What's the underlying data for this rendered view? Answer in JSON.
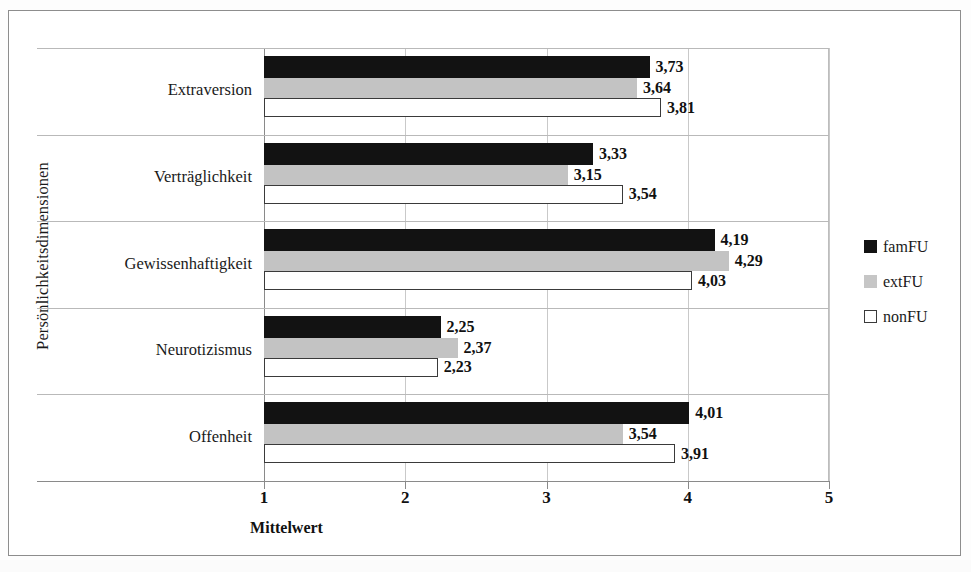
{
  "chart_data": {
    "type": "bar",
    "orientation": "horizontal",
    "title": "",
    "xlabel": "Mittelwert",
    "ylabel": "Persönlichkeitsdimensionen",
    "xlim": [
      1,
      5
    ],
    "xticks": [
      "1",
      "2",
      "3",
      "4",
      "5"
    ],
    "grid": "vertical gridlines at each x tick; horizontal separators between categories",
    "legend_position": "right",
    "categories": [
      "Extraversion",
      "Verträglichkeit",
      "Gewissenhaftigkeit",
      "Neurotizismus",
      "Offenheit"
    ],
    "series": [
      {
        "name": "famFU",
        "color": "#121212",
        "style": "solid-black",
        "values": [
          3.73,
          3.33,
          4.19,
          2.25,
          4.01
        ],
        "labels": [
          "3,73",
          "3,33",
          "4,19",
          "2,25",
          "4,01"
        ]
      },
      {
        "name": "extFU",
        "color": "#c3c3c3",
        "style": "solid-gray",
        "values": [
          3.64,
          3.15,
          4.29,
          2.37,
          3.54
        ],
        "labels": [
          "3,64",
          "3,15",
          "4,29",
          "2,37",
          "3,54"
        ]
      },
      {
        "name": "nonFU",
        "color": "#ffffff",
        "style": "outlined-white",
        "values": [
          3.81,
          3.54,
          4.03,
          2.23,
          3.91
        ],
        "labels": [
          "3,81",
          "3,54",
          "4,03",
          "2,23",
          "3,91"
        ]
      }
    ]
  },
  "legend": {
    "items": [
      {
        "label": "famFU",
        "swatch": "black-square-icon"
      },
      {
        "label": "extFU",
        "swatch": "gray-square-icon"
      },
      {
        "label": "nonFU",
        "swatch": "white-square-icon"
      }
    ]
  }
}
